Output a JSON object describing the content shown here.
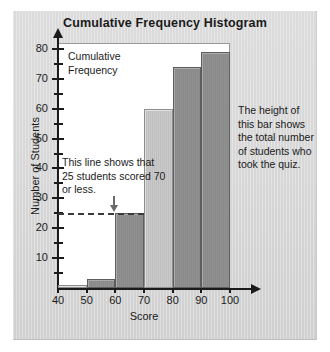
{
  "chart_data": {
    "type": "bar",
    "title": "Cumulative Frequency Histogram",
    "xlabel": "Score",
    "ylabel": "Number of Students",
    "categories": [
      "40-50",
      "50-60",
      "60-70",
      "70-80",
      "80-90",
      "90-100"
    ],
    "bin_edges": [
      40,
      50,
      60,
      70,
      80,
      90,
      100
    ],
    "values": [
      1,
      3,
      25,
      60,
      74,
      79
    ],
    "bar_styles": [
      "light",
      "dark",
      "dark",
      "light",
      "dark",
      "dark"
    ],
    "xlim": [
      40,
      100
    ],
    "ylim": [
      0,
      82
    ],
    "x_ticks": [
      "40",
      "50",
      "60",
      "70",
      "80",
      "90",
      "100"
    ],
    "y_ticks": [
      "10",
      "20",
      "30",
      "40",
      "50",
      "60",
      "70",
      "80"
    ],
    "y_minor_step": 5,
    "grid": false,
    "legend": "none",
    "reference_line": {
      "value": 25,
      "style": "dashed",
      "extends_to_x": 70
    },
    "annotations": [
      {
        "name": "legend",
        "text": "Cumulative\nFrequency"
      },
      {
        "name": "reference-line-note",
        "text": "This line shows that 25 students scored 70 or less."
      },
      {
        "name": "total-students-note",
        "text": "The height of this bar shows the total number of students who took the quiz."
      }
    ]
  },
  "colors": {
    "page_background": "#ffffff",
    "panel_background": "#d9d9d9",
    "plot_background": "#ffffff",
    "axis": "#1b1b1b",
    "bar_light": "#c2c2c2",
    "bar_light_border": "#8d8d8d",
    "bar_dark": "#8d8d8d",
    "bar_dark_border": "#5e5e5e",
    "reference_line": "#3a3a3a",
    "text": "#1b1b1b"
  },
  "labels": {
    "title": "Cumulative Frequency Histogram",
    "x_axis": "Score",
    "y_axis": "Number of Students",
    "legend_line1": "Cumulative",
    "legend_line2": "Frequency",
    "note_refline": "This line shows that 25 students scored 70 or less.",
    "note_total": "The height of this bar shows the total number of students who took the quiz."
  }
}
